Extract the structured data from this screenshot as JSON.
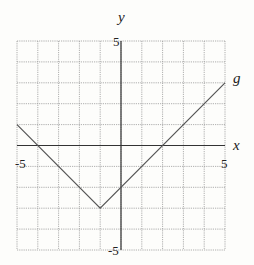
{
  "chart_data": {
    "type": "line",
    "title": "",
    "xlabel": "x",
    "ylabel": "y",
    "xlim": [
      -5,
      5
    ],
    "ylim": [
      -5,
      5
    ],
    "grid": true,
    "grid_step": 1,
    "tick_labels": {
      "x": [
        {
          "value": -5,
          "label": "-5"
        },
        {
          "value": 5,
          "label": "5"
        }
      ],
      "y": [
        {
          "value": 5,
          "label": "5"
        },
        {
          "value": -5,
          "label": "-5"
        }
      ]
    },
    "series": [
      {
        "name": "g",
        "points": [
          [
            -5,
            1
          ],
          [
            -1,
            -3
          ],
          [
            5,
            3
          ]
        ],
        "color": "#555555"
      }
    ],
    "legend": null,
    "annotations": [
      {
        "text": "g",
        "x": 5,
        "y": 3,
        "position": "right of line end"
      }
    ]
  },
  "labels": {
    "x_axis": "x",
    "y_axis": "y",
    "series_name": "g",
    "x_min": "-5",
    "x_max": "5",
    "y_max": "5",
    "y_min": "-5"
  },
  "colors": {
    "background": "#fdfdfb",
    "grid": "#9a9a9a",
    "axis": "#333333",
    "line": "#555555"
  }
}
